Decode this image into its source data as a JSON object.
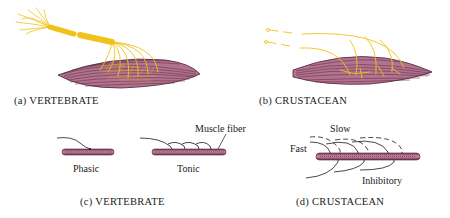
{
  "figure": {
    "panels": [
      {
        "id": "a",
        "caption": "(a) VERTEBRATE"
      },
      {
        "id": "b",
        "caption": "(b) CRUSTACEAN"
      },
      {
        "id": "c",
        "caption": "(c) VERTEBRATE",
        "labels": {
          "phasic": "Phasic",
          "tonic": "Tonic",
          "muscle_fiber": "Muscle fiber"
        }
      },
      {
        "id": "d",
        "caption": "(d) CRUSTACEAN",
        "labels": {
          "slow": "Slow",
          "fast": "Fast",
          "inhibitory": "Inhibitory"
        }
      }
    ],
    "colors": {
      "nerve": "#f2c21b",
      "muscle": "#b06a86",
      "muscle_dark": "#5a2a3c",
      "line": "#1a1a1a"
    }
  }
}
